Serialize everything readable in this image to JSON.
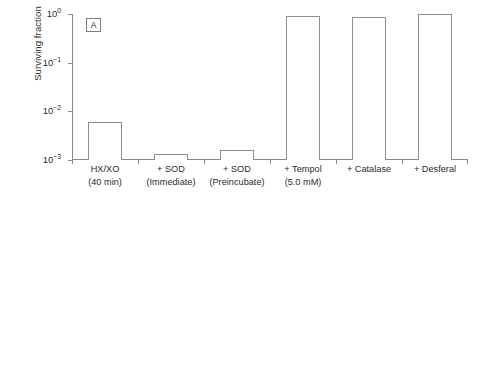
{
  "figure": {
    "background": "#ffffff",
    "line_color": "#8a8a8a",
    "text_color": "#2b2b2b"
  },
  "chart_data": [
    {
      "type": "bar",
      "panel": "A",
      "title": "",
      "xlabel": "",
      "ylabel": "Surviving fraction",
      "yscale": "log",
      "ylim": [
        0.001,
        1
      ],
      "ytick_labels": [
        "10^0",
        "10^-1",
        "10^-2",
        "10^-3"
      ],
      "ytick_values": [
        1,
        0.1,
        0.01,
        0.001
      ],
      "grid": false,
      "legend": "none",
      "categories": [
        "HX/XO (40 min)",
        "+ SOD (Immediate)",
        "+ SOD (Preincubate)",
        "+ Tempol (5.0 mM)",
        "+ Catalase",
        "+ Desferal"
      ],
      "category_lines": [
        [
          "HX/XO",
          "(40 min)"
        ],
        [
          "+ SOD",
          "(Immediate)"
        ],
        [
          "+ SOD",
          "(Preincubate)"
        ],
        [
          "+ Tempol",
          "(5.0 mM)"
        ],
        [
          "+ Catalase",
          ""
        ],
        [
          "+ Desferal",
          ""
        ]
      ],
      "values": [
        0.006,
        0.0013,
        0.0016,
        0.93,
        0.88,
        1.0
      ]
    },
    {
      "type": "bar",
      "panel": "B",
      "title": "",
      "xlabel": "",
      "ylabel": "Surviving fraction",
      "yscale": "log",
      "ylim": [
        0.0001,
        1
      ],
      "ytick_labels": [
        "10^0",
        "10^-1",
        "10^-2",
        "10^-3",
        "10^-4"
      ],
      "ytick_values": [
        1,
        0.1,
        0.01,
        0.001,
        0.0001
      ],
      "grid": false,
      "legend": "none",
      "categories": [
        "Hydrogen peroxide (0.5 mM)",
        "+ Tempol (0.1 mM)",
        "+ Tempol (0.5 mM)",
        "+ Tempol (1.0 mM)",
        "+ Desferal"
      ],
      "category_lines": [
        [
          "Hydrogen peroxide",
          "(0.5 mM)"
        ],
        [
          "+ Tempol",
          "(0.1 mM)"
        ],
        [
          "+ Tempol",
          "(0.5 mM)"
        ],
        [
          "+ Tempol",
          "(1.0 mM)"
        ],
        [
          "+ Desferal",
          ""
        ]
      ],
      "values": [
        0.0006,
        0.021,
        0.21,
        1.0,
        1.0
      ]
    }
  ],
  "panel_a": {
    "tag": "A",
    "ylabel": "Surviving fraction",
    "ticks": [
      {
        "label_base": "10",
        "label_exp": "0"
      },
      {
        "label_base": "10",
        "label_exp": "-1"
      },
      {
        "label_base": "10",
        "label_exp": "-2"
      },
      {
        "label_base": "10",
        "label_exp": "-3"
      }
    ],
    "bars": [
      {
        "l1": "HX/XO",
        "l2": "(40 min)",
        "value": 0.006
      },
      {
        "l1": "+ SOD",
        "l2": "(Immediate)",
        "value": 0.0013
      },
      {
        "l1": "+ SOD",
        "l2": "(Preincubate)",
        "value": 0.0016
      },
      {
        "l1": "+ Tempol",
        "l2": "(5.0 mM)",
        "value": 0.93
      },
      {
        "l1": "+ Catalase",
        "l2": "",
        "value": 0.88
      },
      {
        "l1": "+ Desferal",
        "l2": "",
        "value": 1.0
      }
    ]
  },
  "panel_b": {
    "tag": "B",
    "ylabel": "Surviving fraction",
    "ticks": [
      {
        "label_base": "10",
        "label_exp": "0"
      },
      {
        "label_base": "10",
        "label_exp": "-1"
      },
      {
        "label_base": "10",
        "label_exp": "-2"
      },
      {
        "label_base": "10",
        "label_exp": "-3"
      },
      {
        "label_base": "10",
        "label_exp": "-4"
      }
    ],
    "bars": [
      {
        "l1": "Hydrogen peroxide",
        "l2": "(0.5 mM)",
        "value": 0.0006
      },
      {
        "l1": "+ Tempol",
        "l2": "(0.1 mM)",
        "value": 0.021
      },
      {
        "l1": "+ Tempol",
        "l2": "(0.5 mM)",
        "value": 0.21
      },
      {
        "l1": "+ Tempol",
        "l2": "(1.0 mM)",
        "value": 1.0
      },
      {
        "l1": "+ Desferal",
        "l2": "",
        "value": 1.0
      }
    ]
  }
}
